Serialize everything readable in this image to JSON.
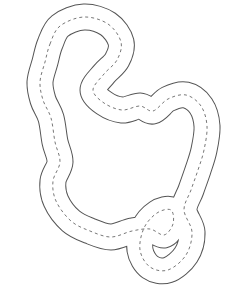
{
  "figure": {
    "colors": {
      "background": "#ffffff",
      "outline": "#555555",
      "fill": "#ffffff",
      "centerline": "#777777"
    },
    "centerline_points": [
      [
        50,
        44
      ],
      [
        60,
        26
      ],
      [
        84,
        17
      ],
      [
        108,
        24
      ],
      [
        121,
        42
      ],
      [
        117,
        60
      ],
      [
        104,
        74
      ],
      [
        93,
        90
      ],
      [
        104,
        103
      ],
      [
        122,
        110
      ],
      [
        140,
        106
      ],
      [
        153,
        111
      ],
      [
        168,
        99
      ],
      [
        186,
        95
      ],
      [
        201,
        106
      ],
      [
        207,
        126
      ],
      [
        204,
        150
      ],
      [
        198,
        170
      ],
      [
        191,
        190
      ],
      [
        184,
        210
      ],
      [
        192,
        232
      ],
      [
        186,
        255
      ],
      [
        168,
        270
      ],
      [
        150,
        267
      ],
      [
        140,
        250
      ],
      [
        144,
        228
      ],
      [
        157,
        213
      ],
      [
        171,
        210
      ],
      [
        173,
        224
      ],
      [
        164,
        235
      ],
      [
        150,
        229
      ],
      [
        132,
        231
      ],
      [
        111,
        237
      ],
      [
        90,
        231
      ],
      [
        71,
        221
      ],
      [
        56,
        201
      ],
      [
        53,
        181
      ],
      [
        60,
        162
      ],
      [
        55,
        142
      ],
      [
        51,
        118
      ],
      [
        43,
        100
      ],
      [
        40,
        82
      ],
      [
        45,
        62
      ]
    ]
  }
}
